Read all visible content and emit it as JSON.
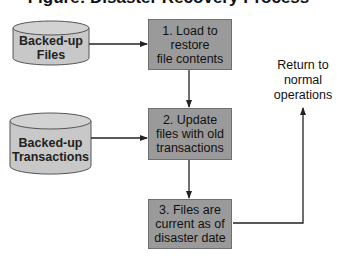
{
  "title": "Figure: Disaster Recovery Process",
  "colors": {
    "box_fill": "#9a9a9a",
    "cylinder_fill": "#c8c8c8",
    "line": "#222222"
  },
  "sources": [
    {
      "id": "files",
      "lines": [
        "Backed-up",
        "Files"
      ]
    },
    {
      "id": "transactions",
      "lines": [
        "Backed-up",
        "Transactions"
      ]
    }
  ],
  "steps": [
    {
      "id": "step1",
      "lines": [
        "1. Load to",
        "restore",
        "file contents"
      ]
    },
    {
      "id": "step2",
      "lines": [
        "2. Update",
        "files with old",
        "transactions"
      ]
    },
    {
      "id": "step3",
      "lines": [
        "3. Files are",
        "current as of",
        "disaster date"
      ]
    }
  ],
  "outcome": {
    "lines": [
      "Return to",
      "normal",
      "operations"
    ]
  }
}
